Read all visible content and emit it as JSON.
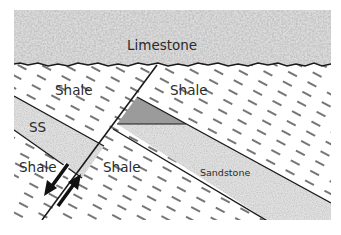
{
  "labels": {
    "limestone": "Limestone",
    "shale_upper_left": "Shale",
    "shale_upper_right": "Shale",
    "ss_left": "SS",
    "shale_lower_left": "Shale",
    "shale_lower_right": "Shale",
    "sandstone_right": "Sandstone"
  },
  "units": [
    {
      "name": "Limestone",
      "pattern": "stippled",
      "color": "#d9d9d9"
    },
    {
      "name": "Shale",
      "pattern": "dashed",
      "color": "#ffffff"
    },
    {
      "name": "Sandstone",
      "pattern": "speckled",
      "color": "#e2e2e2"
    },
    {
      "name": "Wedge",
      "pattern": "solid",
      "color": "#9a9a9a"
    }
  ],
  "features": {
    "fault": "normal fault with paired displacement arrows",
    "unconformity": "wavy contact beneath limestone"
  },
  "colors": {
    "line": "#1a1a1a",
    "limestone": "#d6d6d6",
    "sandstone": "#e0e0e0",
    "wedge": "#9b9b9b",
    "shale_dash": "#2a2a2a"
  }
}
